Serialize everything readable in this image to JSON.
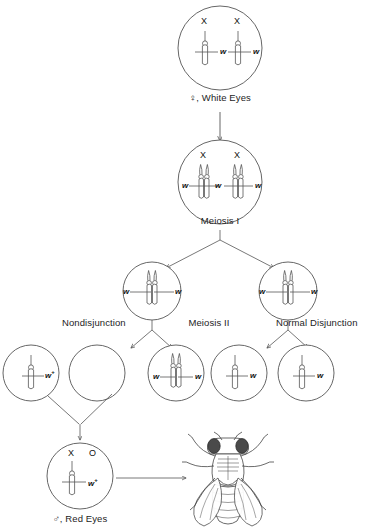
{
  "figure": {
    "stroke_color": "#555555",
    "text_color": "#1a1a1a",
    "background": "#ffffff"
  },
  "labels": {
    "parent": "♀, White Eyes",
    "meiosis_one": "Meiosis I",
    "meiosis_two": "Meiosis II",
    "nondisjunction": "Nondisjunction",
    "normal_disjunction": "Normal Disjunction",
    "offspring": "♂, Red Eyes"
  },
  "cells": {
    "parent_cell": {
      "name": "parent-germ-cell",
      "chromosome_labels": [
        "X",
        "X"
      ],
      "alleles": [
        "w",
        "w"
      ]
    },
    "meiosis_one_cell": {
      "name": "meiosis-one-cell",
      "chromosome_labels": [
        "X",
        "X"
      ],
      "alleles": [
        "w",
        "w",
        "w",
        "w"
      ]
    },
    "secondary_left": {
      "name": "secondary-oocyte-left",
      "alleles": [
        "w",
        "w"
      ]
    },
    "secondary_right": {
      "name": "secondary-oocyte-right",
      "alleles": [
        "w",
        "w"
      ]
    },
    "gametes": [
      {
        "name": "gamete-sperm-wplus",
        "alleles": [
          "w+"
        ],
        "chromosome_count": 1
      },
      {
        "name": "gamete-nullo-x",
        "alleles": [],
        "chromosome_count": 0
      },
      {
        "name": "gamete-diplo-x",
        "alleles": [
          "w",
          "w"
        ],
        "chromosome_count": 2
      },
      {
        "name": "gamete-normal-x-1",
        "alleles": [
          "w"
        ],
        "chromosome_count": 1
      },
      {
        "name": "gamete-normal-x-2",
        "alleles": [
          "w"
        ],
        "chromosome_count": 1
      }
    ],
    "zygote": {
      "name": "zygote-xo",
      "chromosome_labels": [
        "X",
        "O"
      ],
      "alleles": [
        "w+"
      ]
    }
  },
  "organism": {
    "name": "drosophila-fly",
    "description": "Drosophila melanogaster, dorsal view line drawing"
  }
}
